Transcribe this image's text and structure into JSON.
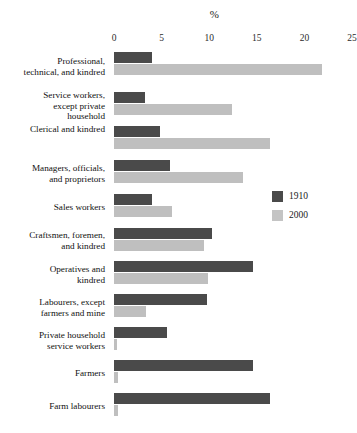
{
  "chart_data": {
    "type": "bar",
    "orientation": "horizontal",
    "title": "%",
    "xlabel": "%",
    "ylabel": "",
    "xlim": [
      0,
      25
    ],
    "xticks": [
      0,
      5,
      10,
      15,
      20,
      25
    ],
    "grid": false,
    "legend_position": "middle-right",
    "categories": [
      "Professional,\ntechnical, and kindred",
      "Service workers,\nexcept private\nhousehold",
      "Clerical and kindred",
      "Managers, officials,\nand proprietors",
      "Sales workers",
      "Craftsmen, foremen,\nand kindred",
      "Operatives and\nkindred",
      "Labourers, except\nfarmers and mine",
      "Private household\nservice workers",
      "Farmers",
      "Farm labourers"
    ],
    "series": [
      {
        "name": "1910",
        "color": "#4a4a4a",
        "values": [
          4.0,
          3.3,
          4.8,
          5.9,
          4.0,
          10.3,
          14.6,
          9.8,
          5.6,
          14.6,
          16.4
        ]
      },
      {
        "name": "2000",
        "color": "#bfbfbf",
        "values": [
          21.9,
          12.4,
          16.4,
          13.5,
          6.1,
          9.5,
          9.9,
          3.4,
          0.3,
          0.4,
          0.4
        ]
      }
    ]
  },
  "legend": {
    "items": [
      {
        "label": "1910",
        "color": "#4a4a4a"
      },
      {
        "label": "2000",
        "color": "#c4c4c4"
      }
    ]
  }
}
